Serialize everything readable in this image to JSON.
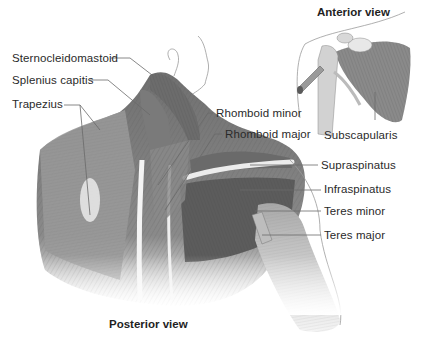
{
  "diagram": {
    "type": "anatomical-illustration"
  },
  "views": {
    "anterior": {
      "title": "Anterior view"
    },
    "posterior": {
      "title": "Posterior view"
    }
  },
  "labels": {
    "sternocleidomastoid": "Sternocleidomastoid",
    "splenius_capitis": "Splenius capitis",
    "trapezius": "Trapezius",
    "rhomboid_minor": "Rhomboid minor",
    "rhomboid_major": "Rhomboid major",
    "supraspinatus": "Supraspinatus",
    "infraspinatus": "Infraspinatus",
    "teres_minor": "Teres minor",
    "teres_major": "Teres major",
    "subscapularis": "Subscapularis"
  },
  "colors": {
    "background": "#ffffff",
    "text": "#2a2a2a",
    "leader_line": "#6a6a6a",
    "muscle_dark": "#5e5e5e",
    "muscle_mid": "#8c8c8c",
    "muscle_light": "#c4c4c4",
    "bone": "#e6e6e6"
  }
}
